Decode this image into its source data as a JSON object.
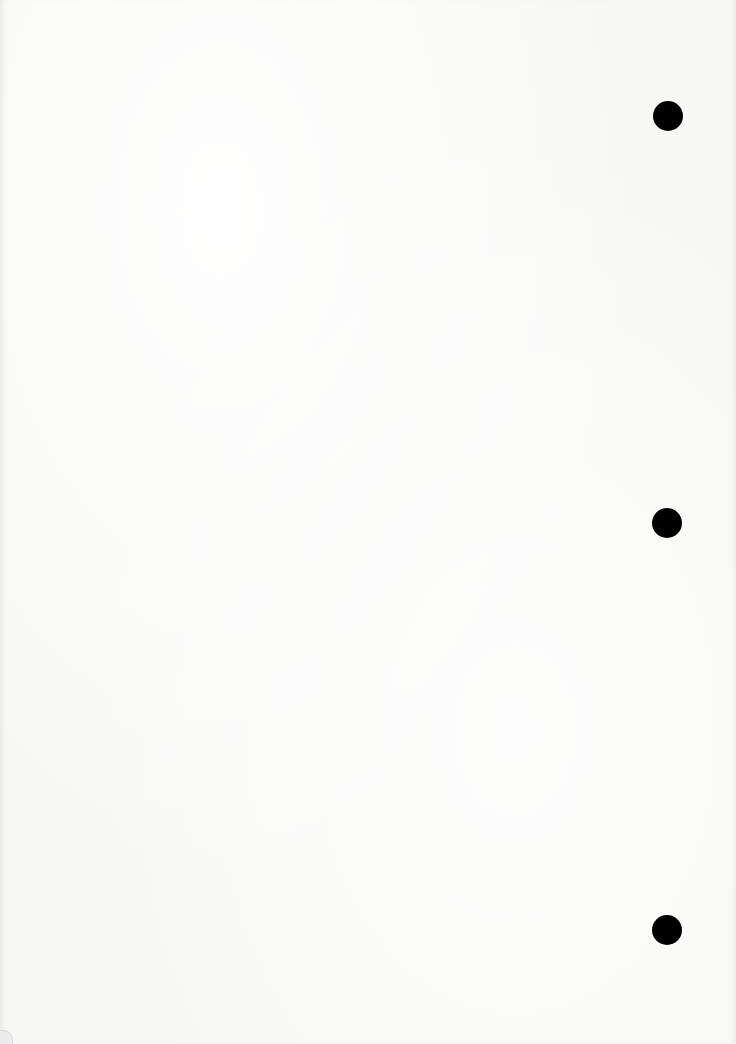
{
  "document": {
    "type": "blank-page",
    "text": "",
    "punch_holes": [
      {
        "id": "hole-top",
        "icon": "punch-hole-icon"
      },
      {
        "id": "hole-middle",
        "icon": "punch-hole-icon"
      },
      {
        "id": "hole-bottom",
        "icon": "punch-hole-icon"
      }
    ],
    "colors": {
      "paper": "#f7f7f5",
      "hole": "#000000"
    }
  }
}
